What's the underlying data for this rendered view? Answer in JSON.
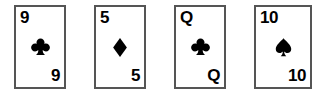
{
  "scene": {
    "title": "Playing card row",
    "background_color": "#ffffff",
    "card_border_color": "#555555",
    "ink_color": "#000000"
  },
  "cards": [
    {
      "rank": "9",
      "suit_name": "clubs",
      "suit_icon": "club-icon",
      "suit_color": "#000000",
      "label": "9 of clubs",
      "rank_top": "9",
      "rank_bottom": "9"
    },
    {
      "rank": "5",
      "suit_name": "diamonds",
      "suit_icon": "diamond-icon",
      "suit_color": "#000000",
      "label": "5 of diamonds",
      "rank_top": "5",
      "rank_bottom": "5"
    },
    {
      "rank": "Q",
      "suit_name": "clubs",
      "suit_icon": "club-icon",
      "suit_color": "#000000",
      "label": "Queen of clubs",
      "rank_top": "Q",
      "rank_bottom": "Q"
    },
    {
      "rank": "10",
      "suit_name": "spades",
      "suit_icon": "spade-icon",
      "suit_color": "#000000",
      "label": "10 of spades",
      "rank_top": "10",
      "rank_bottom": "10"
    }
  ]
}
